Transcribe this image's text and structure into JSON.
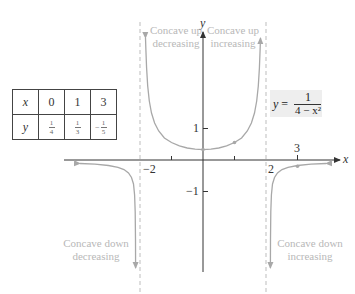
{
  "table": {
    "headers": {
      "x": "x",
      "y": "y"
    },
    "columns": [
      {
        "x": "0",
        "y_num": "1",
        "y_den": "4",
        "y_sign": ""
      },
      {
        "x": "1",
        "y_num": "1",
        "y_den": "3",
        "y_sign": ""
      },
      {
        "x": "3",
        "y_num": "1",
        "y_den": "5",
        "y_sign": "−"
      }
    ]
  },
  "equation": {
    "lhs_var": "y",
    "equals": " =",
    "numerator": "1",
    "denominator": "4 − x²"
  },
  "axes": {
    "x_label": "x",
    "y_label": "y",
    "x_ticks": [
      {
        "value": -2,
        "label": "−2"
      },
      {
        "value": 2,
        "label": "2"
      },
      {
        "value": 3,
        "label": "3"
      }
    ],
    "y_ticks": [
      {
        "value": 1,
        "label": "1"
      },
      {
        "value": -1,
        "label": "−1"
      }
    ]
  },
  "regions": {
    "left_top_1": "Concave up",
    "left_top_2": "decreasing",
    "right_top_1": "Concave up",
    "right_top_2": "increasing",
    "left_bottom_1": "Concave down",
    "left_bottom_2": "decreasing",
    "right_bottom_1": "Concave down",
    "right_bottom_2": "increasing"
  },
  "asymptotes": [
    -2,
    2
  ],
  "plotted_points": [
    {
      "x": 0,
      "y": 0.25
    },
    {
      "x": 1,
      "y": 0.3333
    },
    {
      "x": 3,
      "y": -0.2
    }
  ],
  "colors": {
    "curve": "#a8a8a8",
    "axis": "#333333",
    "asymptote": "#bdbdbd",
    "label": "#b8b8b8",
    "equation_bg": "#eeeeee"
  }
}
